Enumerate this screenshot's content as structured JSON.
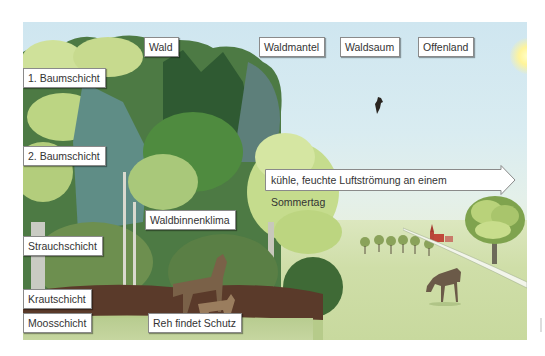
{
  "figure": {
    "type": "illustration"
  },
  "zone_labels": [
    "Wald",
    "Waldmantel",
    "Waldsaum",
    "Offenland"
  ],
  "layer_labels": [
    "1. Baumschicht",
    "2. Baumschicht",
    "Strauchschicht",
    "Krautschicht",
    "Moosschicht"
  ],
  "annotations": {
    "climate": "Waldbinnenklima",
    "deer": "Reh findet Schutz",
    "airflow": "kühle, feuchte Luftströmung an einem Sommertag"
  },
  "icons": {
    "sun": "sun-icon",
    "bird": "bird-icon",
    "deer": "deer-icon",
    "church": "church-icon",
    "arrow": "arrow-right-icon"
  },
  "colors": {
    "sky": "#d3e8f1",
    "meadow": "#cddca5",
    "forest_dark": "#3f6b3a",
    "forest_light": "#c9dc8f",
    "label_bg": "#ffffff",
    "label_border": "#8a8a8a"
  }
}
